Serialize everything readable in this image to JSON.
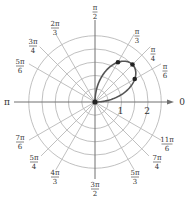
{
  "figure": {
    "type": "polar-graph",
    "center": {
      "x": 95,
      "y": 102
    },
    "unit_px": 26.5,
    "ring_step": 0.5,
    "ring_count": 5,
    "colors": {
      "grid": "#b9b9b9",
      "axis": "#707070",
      "curve": "#555555",
      "points": "#222222",
      "text": "#333333"
    }
  },
  "axis_labels": {
    "zero": "0",
    "pi": "π"
  },
  "radial_tick_labels": [
    {
      "value": 1,
      "label": "1"
    },
    {
      "value": 2,
      "label": "2"
    }
  ],
  "angle_labels": [
    {
      "angle_deg": 90,
      "num": "π",
      "den": "2",
      "x": 95,
      "y": 4
    },
    {
      "angle_deg": 60,
      "num": "π",
      "den": "3",
      "x": 137,
      "y": 28
    },
    {
      "angle_deg": 45,
      "num": "π",
      "den": "4",
      "x": 153,
      "y": 46
    },
    {
      "angle_deg": 30,
      "num": "π",
      "den": "6",
      "x": 165,
      "y": 63
    },
    {
      "angle_deg": 120,
      "num": "2π",
      "den": "3",
      "x": 55,
      "y": 20
    },
    {
      "angle_deg": 135,
      "num": "3π",
      "den": "4",
      "x": 33,
      "y": 38
    },
    {
      "angle_deg": 150,
      "num": "5π",
      "den": "6",
      "x": 20,
      "y": 58
    },
    {
      "angle_deg": 210,
      "num": "7π",
      "den": "6",
      "x": 20,
      "y": 134
    },
    {
      "angle_deg": 225,
      "num": "5π",
      "den": "4",
      "x": 34,
      "y": 154
    },
    {
      "angle_deg": 240,
      "num": "4π",
      "den": "3",
      "x": 55,
      "y": 169
    },
    {
      "angle_deg": 270,
      "num": "3π",
      "den": "2",
      "x": 95,
      "y": 181
    },
    {
      "angle_deg": 300,
      "num": "5π",
      "den": "3",
      "x": 135,
      "y": 169
    },
    {
      "angle_deg": 315,
      "num": "7π",
      "den": "4",
      "x": 157,
      "y": 154
    },
    {
      "angle_deg": 330,
      "num": "11π",
      "den": "6",
      "x": 167,
      "y": 136
    }
  ],
  "curve": {
    "equation": "r = 2 sin 2θ",
    "theta_range_deg": [
      0,
      90
    ],
    "marked_points": [
      {
        "theta": "0",
        "theta_deg": 0,
        "r": 0
      },
      {
        "theta": "π/6",
        "theta_deg": 30,
        "r": 1.732
      },
      {
        "theta": "π/4",
        "theta_deg": 45,
        "r": 2
      },
      {
        "theta": "π/3",
        "theta_deg": 60,
        "r": 1.732
      }
    ]
  }
}
